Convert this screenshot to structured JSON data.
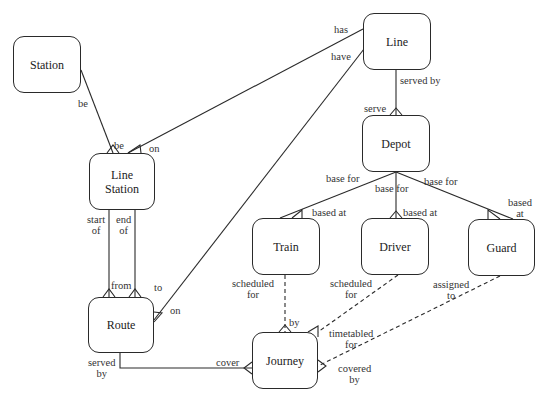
{
  "entities": {
    "station": "Station",
    "line_station": "Line\nStation",
    "line": "Line",
    "depot": "Depot",
    "route": "Route",
    "train": "Train",
    "driver": "Driver",
    "guard": "Guard",
    "journey": "Journey"
  },
  "labels": {
    "station_be": "be",
    "ls_be": "be",
    "ls_on": "on",
    "line_has": "has",
    "line_have": "have",
    "line_served_by": "served by",
    "depot_serve": "serve",
    "ls_start_of": "start\nof",
    "ls_end_of": "end\nof",
    "route_from": "from",
    "route_to": "to",
    "route_on": "on",
    "route_served_by": "served\nby",
    "journey_cover": "cover",
    "depot_base_for_1": "base for",
    "depot_base_for_2": "base for",
    "depot_base_for_3": "base for",
    "train_based_at": "based at",
    "driver_based_at": "based at",
    "guard_based_at": "based\nat",
    "train_scheduled_for": "scheduled\nfor",
    "driver_scheduled_for": "scheduled\nfor",
    "guard_assigned_to": "assigned\nto",
    "journey_by": "by",
    "journey_timetabled_for": "timetabled\nfor",
    "journey_covered_by": "covered\nby"
  }
}
